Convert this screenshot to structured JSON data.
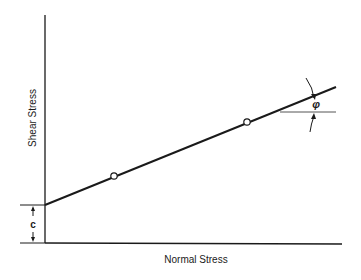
{
  "diagram": {
    "type": "mohr-coulomb-failure-envelope",
    "x_axis_label": "Normal Stress",
    "y_axis_label": "Shear Stress",
    "intercept_label": "c",
    "angle_label": "φ",
    "data_points": [
      {
        "x": 114,
        "y": 176
      },
      {
        "x": 247,
        "y": 122
      }
    ],
    "colors": {
      "line": "#1a1a1a",
      "background": "#ffffff"
    }
  }
}
